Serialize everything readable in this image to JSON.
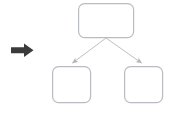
{
  "diagram": {
    "background_color": "#ffffff",
    "pointer": {
      "icon": "right-arrow-icon",
      "label": "",
      "color": "#3b3b3b",
      "x": 11,
      "y": 43,
      "width": 23,
      "height": 14
    },
    "node_style": {
      "stroke_color": "#b9bcc0",
      "fill_color": "#ffffff",
      "stroke_width": 1.2,
      "corner_radius": 6
    },
    "connector_style": {
      "stroke_color": "#bcbfc3",
      "stroke_width": 1,
      "arrowhead": "triangle"
    },
    "nodes": [
      {
        "id": "node-parent",
        "name": "parent-node",
        "label": "",
        "x": 78,
        "y": 3,
        "width": 56,
        "height": 35
      },
      {
        "id": "node-child-left",
        "name": "child-node-left",
        "label": "",
        "x": 52,
        "y": 66,
        "width": 39,
        "height": 37
      },
      {
        "id": "node-child-right",
        "name": "child-node-right",
        "label": "",
        "x": 124,
        "y": 66,
        "width": 39,
        "height": 37
      }
    ],
    "edges": [
      {
        "id": "edge-parent-to-left",
        "name": "connector-parent-to-child-left",
        "from": "node-parent",
        "to": "node-child-left",
        "label": "",
        "x1": 106,
        "y1": 38,
        "x2": 71,
        "y2": 64
      },
      {
        "id": "edge-parent-to-right",
        "name": "connector-parent-to-child-right",
        "from": "node-parent",
        "to": "node-child-right",
        "label": "",
        "x1": 106,
        "y1": 38,
        "x2": 143,
        "y2": 64
      }
    ]
  }
}
